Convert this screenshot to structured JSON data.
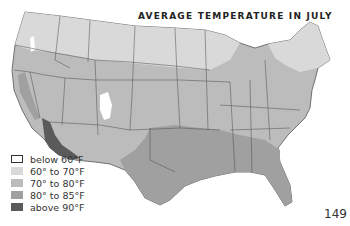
{
  "title": "AVERAGE TEMPERATURE IN JULY",
  "page_number": "149",
  "legend": [
    {
      "label": "below 60°F",
      "color": "#ffffff",
      "border": "#333333"
    },
    {
      "label": "60° to 70°F",
      "color": "#d9d9d9",
      "border": "none"
    },
    {
      "label": "70° to 80°F",
      "color": "#bcbcbc",
      "border": "none"
    },
    {
      "label": "80° to 85°F",
      "color": "#a0a0a0",
      "border": "none"
    },
    {
      "label": "above 90°F",
      "color": "#5a5a5a",
      "border": "none"
    }
  ],
  "map": {
    "region": "Contiguous United States",
    "state_border_color": "#4a4a4a"
  }
}
